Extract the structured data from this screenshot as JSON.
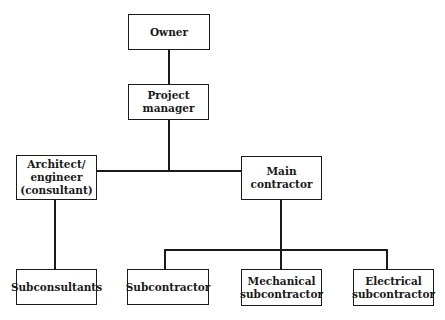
{
  "diagram": {
    "type": "org-chart",
    "nodes": [
      {
        "id": "owner",
        "label": "Owner"
      },
      {
        "id": "project_manager",
        "label": "Project manager"
      },
      {
        "id": "architect",
        "label": "Architect/\nengineer\n(consultant)"
      },
      {
        "id": "main_contractor",
        "label": "Main contractor"
      },
      {
        "id": "subconsultants",
        "label": "Subconsultants"
      },
      {
        "id": "subcontractor",
        "label": "Subcontractor"
      },
      {
        "id": "mechanical",
        "label": "Mechanical\nsubcontractor"
      },
      {
        "id": "electrical",
        "label": "Electrical\nsubcontractor"
      }
    ],
    "edges": [
      {
        "from": "owner",
        "to": "project_manager"
      },
      {
        "from": "project_manager",
        "to": "architect"
      },
      {
        "from": "project_manager",
        "to": "main_contractor"
      },
      {
        "from": "architect",
        "to": "subconsultants"
      },
      {
        "from": "main_contractor",
        "to": "subcontractor"
      },
      {
        "from": "main_contractor",
        "to": "mechanical"
      },
      {
        "from": "main_contractor",
        "to": "electrical"
      }
    ]
  },
  "labels": {
    "owner": "Owner",
    "project_manager": "Project manager",
    "architect": "Architect/\nengineer\n(consultant)",
    "main_contractor": "Main contractor",
    "subconsultants": "Subconsultants",
    "subcontractor": "Subcontractor",
    "mechanical": "Mechanical\nsubcontractor",
    "electrical": "Electrical\nsubcontractor"
  },
  "colors": {
    "line": "#1a1a1a",
    "background": "#ffffff"
  }
}
